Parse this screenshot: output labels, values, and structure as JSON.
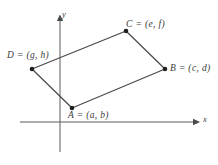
{
  "figure": {
    "kind": "coordinate-plane-parallelogram-diagram",
    "background_color": "#ffffff",
    "line_color": "#4a4a4a",
    "axis_color": "#5a5a5a",
    "text_color": "#3a3a3a",
    "axes": {
      "x_axis": {
        "label": "x",
        "x1": 20,
        "y1": 122,
        "x2": 196,
        "y2": 122,
        "arrow_at": "end"
      },
      "y_axis": {
        "label": "y",
        "x1": 60,
        "y1": 152,
        "x2": 60,
        "y2": 18,
        "arrow_at": "end"
      },
      "origin": {
        "x": 60,
        "y": 122
      }
    },
    "shape": {
      "name": "parallelogram",
      "vertex_order": [
        "A",
        "B",
        "C",
        "D"
      ],
      "closed": true
    },
    "points": [
      {
        "id": "A",
        "label": "A = (a, b)",
        "x": 72,
        "y": 108
      },
      {
        "id": "B",
        "label": "B = (c, d)",
        "x": 165,
        "y": 69
      },
      {
        "id": "C",
        "label": "C = (e, f)",
        "x": 126,
        "y": 31
      },
      {
        "id": "D",
        "label": "D = (g, h)",
        "x": 32,
        "y": 69
      }
    ]
  }
}
